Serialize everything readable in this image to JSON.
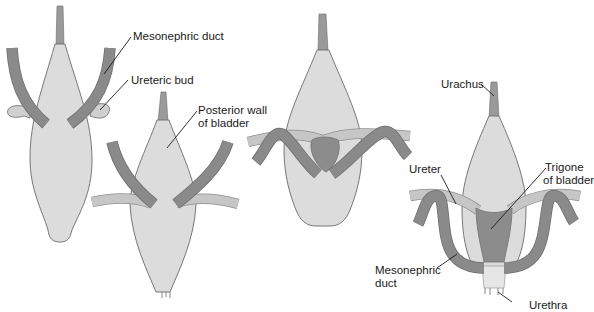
{
  "figure": {
    "panels": [
      {
        "id": "stage-1",
        "labels": [
          "Mesonephric duct",
          "Ureteric bud"
        ]
      },
      {
        "id": "stage-2",
        "labels": [
          "Posterior wall of bladder"
        ]
      },
      {
        "id": "stage-3",
        "labels": []
      },
      {
        "id": "stage-4",
        "labels": [
          "Urachus",
          "Ureter",
          "Trigone of bladder",
          "Mesonephric duct",
          "Urethra"
        ]
      }
    ]
  },
  "labels": {
    "mesonephric_duct_top": "Mesonephric duct",
    "ureteric_bud": "Ureteric bud",
    "posterior_wall_line1": "Posterior wall",
    "posterior_wall_line2": "of bladder",
    "urachus": "Urachus",
    "ureter": "Ureter",
    "trigone_line1": "Trigone",
    "trigone_line2": "of bladder",
    "mesonephric_bottom_line1": "Mesonephric",
    "mesonephric_bottom_line2": "duct",
    "urethra": "Urethra"
  },
  "colors": {
    "background": "#ffffff",
    "bladder_fill": "#dcdcdc",
    "outline": "#6a6a6a",
    "mesonephric_duct": "#8a8a8a",
    "ureter": "#c6c6c6",
    "trigone": "#8c8c8c",
    "text": "#1a1a1a"
  }
}
